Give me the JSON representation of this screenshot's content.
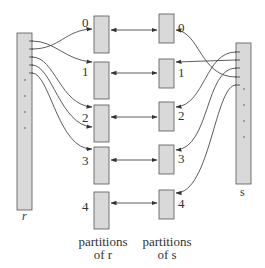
{
  "diagram": {
    "relation_r": {
      "label": "r"
    },
    "relation_s": {
      "label": "s"
    },
    "partitions_r": {
      "caption_line1": "partitions",
      "caption_line2": "of r",
      "indices": [
        "0",
        "1",
        "2",
        "3",
        "4"
      ]
    },
    "partitions_s": {
      "caption_line1": "partitions",
      "caption_line2": "of s",
      "indices": [
        "0",
        "1",
        "2",
        "3",
        "4"
      ]
    },
    "colors": {
      "box_fill": "#d9d9d9",
      "stroke": "#333333",
      "background": "#ffffff"
    }
  }
}
